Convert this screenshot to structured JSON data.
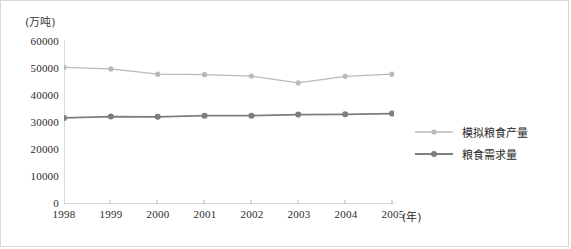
{
  "axes": {
    "y_unit_label": "(万吨)",
    "x_unit_label": "(年)",
    "y_ticks": [
      "60000",
      "50000",
      "40000",
      "30000",
      "20000",
      "10000",
      "0"
    ],
    "x_ticks": [
      "1998",
      "1999",
      "2000",
      "2001",
      "2002",
      "2003",
      "2004",
      "2005"
    ]
  },
  "legend": {
    "items": [
      {
        "label": "模拟粮食产量",
        "color": "#b9b9b9"
      },
      {
        "label": "粮食需求量",
        "color": "#7d7d7d"
      }
    ]
  },
  "chart_data": {
    "type": "line",
    "title": "",
    "xlabel": "(年)",
    "ylabel": "(万吨)",
    "x": [
      "1998",
      "1999",
      "2000",
      "2001",
      "2002",
      "2003",
      "2004",
      "2005"
    ],
    "ylim": [
      0,
      60000
    ],
    "yticks": [
      0,
      10000,
      20000,
      30000,
      40000,
      50000,
      60000
    ],
    "grid": false,
    "legend_position": "right",
    "series": [
      {
        "name": "模拟粮食产量",
        "color": "#b9b9b9",
        "marker": "circle",
        "values": [
          50000,
          49400,
          47500,
          47300,
          46800,
          44300,
          46700,
          47500
        ]
      },
      {
        "name": "粮食需求量",
        "color": "#7d7d7d",
        "marker": "circle",
        "values": [
          31500,
          32000,
          31900,
          32300,
          32300,
          32700,
          32800,
          33100
        ]
      }
    ]
  }
}
